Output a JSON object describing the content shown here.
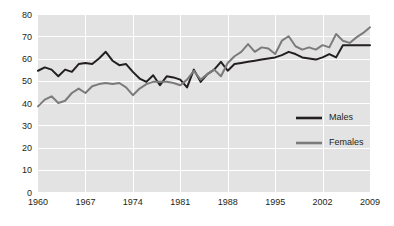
{
  "chart_data": {
    "type": "line",
    "title": "",
    "subtitle": "",
    "xlabel": "",
    "ylabel": "",
    "xlim": [
      1960,
      2009
    ],
    "ylim": [
      0,
      80
    ],
    "grid": true,
    "grid_axis": "both",
    "legend_position": "inside-right",
    "yticks": [
      0,
      10,
      20,
      30,
      40,
      50,
      60,
      70,
      80
    ],
    "xticks": [
      1960,
      1967,
      1974,
      1981,
      1988,
      1995,
      2002,
      2009
    ],
    "x": [
      1960,
      1961,
      1962,
      1963,
      1964,
      1965,
      1966,
      1967,
      1968,
      1969,
      1970,
      1971,
      1972,
      1973,
      1974,
      1975,
      1976,
      1977,
      1978,
      1979,
      1980,
      1981,
      1982,
      1983,
      1984,
      1985,
      1986,
      1987,
      1988,
      1989,
      1990,
      1991,
      1992,
      1993,
      1994,
      1995,
      1996,
      1997,
      1998,
      1999,
      2000,
      2001,
      2002,
      2003,
      2004,
      2005,
      2006,
      2007,
      2008,
      2009
    ],
    "series": [
      {
        "name": "Males",
        "color": "#231f20",
        "values": [
          54.5,
          56.0,
          55.0,
          52.0,
          55.0,
          54.0,
          57.5,
          58.0,
          57.5,
          60.0,
          63.0,
          59.0,
          57.0,
          57.5,
          54.0,
          51.0,
          49.5,
          52.5,
          48.0,
          52.0,
          51.5,
          50.5,
          47.0,
          55.0,
          49.5,
          53.0,
          55.0,
          58.5,
          54.5,
          57.5,
          58.0,
          58.5,
          59.0,
          59.5,
          60.0,
          60.5,
          61.5,
          63.0,
          62.0,
          60.5,
          60.0,
          59.5,
          60.5,
          62.0,
          60.5,
          66.0,
          66.0,
          66.0,
          66.0,
          66.0
        ]
      },
      {
        "name": "Females",
        "color": "#7b7b7b",
        "values": [
          38.5,
          41.5,
          43.0,
          40.0,
          41.0,
          44.5,
          46.5,
          44.5,
          47.5,
          48.5,
          49.0,
          48.5,
          49.0,
          47.0,
          43.5,
          46.5,
          48.5,
          49.5,
          49.5,
          49.5,
          49.0,
          48.0,
          50.5,
          54.5,
          50.5,
          53.0,
          55.0,
          52.0,
          58.0,
          61.0,
          63.0,
          66.5,
          63.0,
          65.0,
          64.5,
          62.0,
          68.0,
          70.0,
          65.5,
          64.0,
          65.0,
          64.0,
          66.0,
          65.0,
          71.0,
          68.0,
          67.0,
          69.5,
          71.5,
          74.0
        ]
      }
    ]
  },
  "legend": {
    "items": [
      {
        "label": "Males",
        "color": "#231f20"
      },
      {
        "label": "Females",
        "color": "#7b7b7b"
      }
    ]
  },
  "style": {
    "plot_background": "#e3e3e3",
    "gridline_color": "#ffffff",
    "page_background": "#ffffff",
    "text_color": "#231f20"
  }
}
